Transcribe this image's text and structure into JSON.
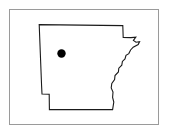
{
  "figure": {
    "type": "map",
    "title": "",
    "caption": "",
    "background_color": "#ffffff"
  },
  "frame": {
    "visible": true,
    "border_color": "#9a9a9a",
    "border_width_px": 1,
    "x": 9,
    "y": 9,
    "width": 150,
    "height": 116
  },
  "map": {
    "region_name": "Arkansas",
    "shape_kind": "state-outline",
    "fill_color": "#ffffff",
    "stroke_color": "#1a1a1a",
    "stroke_width_px": 1.1,
    "outline_path": "M 39.2 24.6 L 122.8 25.6 L 123.2 37.4 L 131.0 37.6 L 135.8 37.2 L 133.4 40.4 L 136.0 42.2 L 139.6 41.6 L 138.2 44.6 L 133.2 47.2 L 130.6 50.0 L 128.8 53.6 L 126.0 55.4 L 125.0 59.0 L 122.4 61.4 L 121.8 65.2 L 118.8 68.2 L 118.4 72.0 L 115.0 75.6 L 114.6 79.6 L 111.8 83.4 L 111.2 88.0 L 113.0 92.0 L 112.6 97.4 L 113.8 102.0 L 112.6 109.6 L 49.4 109.6 L 49.2 94.2 L 42.0 94.0 L 41.6 86.0 Z",
    "markers": [
      {
        "name": "location-dot",
        "x": 61.5,
        "y": 53.5,
        "radius_px": 4.2,
        "color": "#000000",
        "label": ""
      }
    ]
  }
}
